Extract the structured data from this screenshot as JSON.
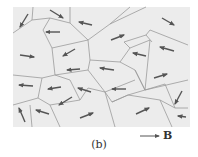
{
  "figure": {
    "caption": "(b)",
    "field_label": "B",
    "field_vector_marker": "→",
    "colors": {
      "panel_fill": "#ececec",
      "boundary": "#9a9a9a",
      "arrow": "#555555",
      "text": "#333333"
    },
    "panel": {
      "x": 13,
      "y": 7,
      "width": 177,
      "height": 120
    },
    "boundaries": [
      "M33,7 L32,20 L13,33",
      "M32,20 L50,18 L70,23 L70,7",
      "M70,23 L88,40 L90,60",
      "M50,18 L43,30 L52,48 L88,40",
      "M88,40 L110,24 L130,7",
      "M110,24 L146,7",
      "M52,48 L55,75",
      "M55,75 L88,70 L90,60",
      "M13,75 L42,78 L55,75",
      "M42,78 L38,98 L13,105",
      "M38,98 L50,105 L80,100",
      "M80,100 L88,88 L105,92",
      "M55,75 L70,80 L80,100",
      "M88,70 L105,92 L135,80",
      "M90,60 L120,62 L135,70",
      "M135,70 L145,90",
      "M120,62 L130,48 L150,40",
      "M130,48 L124,42 L146,35 L152,42",
      "M146,35 L150,30 L188,45",
      "M150,40 L145,90",
      "M135,70 L145,90 L165,84",
      "M145,90 L188,80",
      "M105,92 L112,102 L128,95 L145,90",
      "M105,92 L115,127",
      "M112,102 L128,95",
      "M30,105 L32,127",
      "M50,105 L60,127",
      "M128,95 L160,100 L172,127",
      "M160,100 L175,108 L188,108",
      "M165,84 L175,108"
    ],
    "arrows": [
      {
        "x1": 28,
        "y1": 14,
        "x2": 20,
        "y2": 27
      },
      {
        "x1": 50,
        "y1": 10,
        "x2": 63,
        "y2": 18
      },
      {
        "x1": 92,
        "y1": 25,
        "x2": 79,
        "y2": 22
      },
      {
        "x1": 162,
        "y1": 18,
        "x2": 174,
        "y2": 25
      },
      {
        "x1": 60,
        "y1": 32,
        "x2": 46,
        "y2": 32
      },
      {
        "x1": 111,
        "y1": 40,
        "x2": 124,
        "y2": 35
      },
      {
        "x1": 75,
        "y1": 49,
        "x2": 63,
        "y2": 56
      },
      {
        "x1": 20,
        "y1": 55,
        "x2": 34,
        "y2": 57
      },
      {
        "x1": 146,
        "y1": 56,
        "x2": 133,
        "y2": 53
      },
      {
        "x1": 174,
        "y1": 51,
        "x2": 160,
        "y2": 47
      },
      {
        "x1": 80,
        "y1": 69,
        "x2": 67,
        "y2": 70
      },
      {
        "x1": 114,
        "y1": 70,
        "x2": 100,
        "y2": 68
      },
      {
        "x1": 154,
        "y1": 78,
        "x2": 167,
        "y2": 74
      },
      {
        "x1": 33,
        "y1": 86,
        "x2": 19,
        "y2": 85
      },
      {
        "x1": 61,
        "y1": 87,
        "x2": 48,
        "y2": 89
      },
      {
        "x1": 91,
        "y1": 92,
        "x2": 78,
        "y2": 88
      },
      {
        "x1": 126,
        "y1": 89,
        "x2": 112,
        "y2": 89
      },
      {
        "x1": 182,
        "y1": 91,
        "x2": 175,
        "y2": 104
      },
      {
        "x1": 72,
        "y1": 97,
        "x2": 59,
        "y2": 105
      },
      {
        "x1": 25,
        "y1": 122,
        "x2": 19,
        "y2": 108
      },
      {
        "x1": 49,
        "y1": 114,
        "x2": 36,
        "y2": 110
      },
      {
        "x1": 80,
        "y1": 118,
        "x2": 93,
        "y2": 113
      },
      {
        "x1": 136,
        "y1": 114,
        "x2": 149,
        "y2": 108
      },
      {
        "x1": 186,
        "y1": 117,
        "x2": 178,
        "y2": 116
      }
    ],
    "field_arrow": {
      "x1": 140,
      "y1": 136,
      "x2": 159,
      "y2": 136
    }
  }
}
